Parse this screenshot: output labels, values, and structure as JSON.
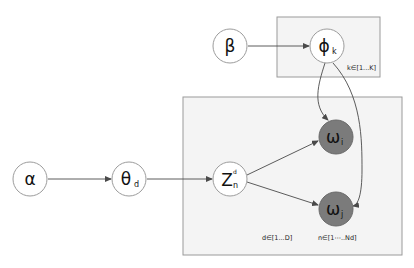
{
  "diagram": {
    "type": "plate-notation graphical model",
    "plates": {
      "topic": {
        "label": "k∈[1...K]"
      },
      "document": {
        "label_d": "d∈[1...D]",
        "label_n": "n∈[1⋯..Nd]"
      }
    },
    "nodes": {
      "alpha": {
        "symbol": "α",
        "subscript": "",
        "observed": false
      },
      "theta": {
        "symbol": "θ",
        "subscript": "d",
        "observed": false
      },
      "z": {
        "symbol": "Z",
        "subscript": "n",
        "superscript": "d",
        "observed": false
      },
      "beta": {
        "symbol": "β",
        "subscript": "",
        "observed": false
      },
      "phi": {
        "symbol": "ϕ",
        "subscript": "k",
        "observed": false
      },
      "omega_i": {
        "symbol": "ω",
        "subscript": "i",
        "observed": true
      },
      "omega_j": {
        "symbol": "ω",
        "subscript": "j",
        "observed": true
      }
    },
    "edges": [
      {
        "from": "alpha",
        "to": "theta"
      },
      {
        "from": "theta",
        "to": "z"
      },
      {
        "from": "z",
        "to": "omega_i"
      },
      {
        "from": "z",
        "to": "omega_j"
      },
      {
        "from": "beta",
        "to": "phi"
      },
      {
        "from": "phi",
        "to": "omega_i"
      },
      {
        "from": "phi",
        "to": "omega_j"
      }
    ],
    "colors": {
      "observed_fill": "#7b7b7b",
      "latent_fill": "#ffffff",
      "plate_fill": "#f4f4f4"
    }
  }
}
